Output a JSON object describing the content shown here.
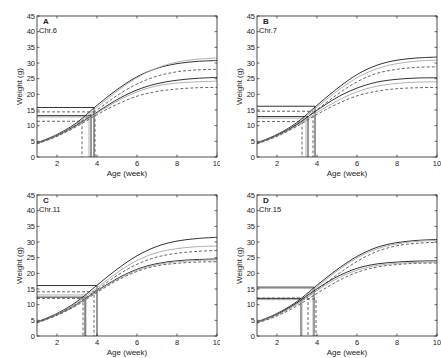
{
  "_note": "Only panel letters, chromosome labels, axis labels, and tick values are read directly from the figure. All curve points, plateau heights, knee points, and reference-line heights are ESTIMATED by reading pixels against gridlines; the figure has no data labels.",
  "chart_data": [
    {
      "type": "line",
      "panel": "A",
      "subtitle": "Chr.6",
      "xlabel": "Age (week)",
      "ylabel": "Weight (g)",
      "xlim": [
        1,
        10
      ],
      "ylim": [
        0,
        45
      ],
      "xticks": [
        2,
        4,
        6,
        8,
        10
      ],
      "yticks": [
        0,
        5,
        10,
        15,
        20,
        25,
        30,
        35,
        40,
        45
      ],
      "grid": false,
      "values_estimated": true,
      "series": [
        {
          "name": "solid-upper",
          "style": "solid",
          "x": [
            1,
            2,
            3,
            4,
            5,
            6,
            7,
            8,
            9,
            10
          ],
          "y": [
            4.5,
            7.2,
            11,
            16.5,
            21.5,
            25.6,
            28.3,
            29.8,
            30.5,
            30.8
          ]
        },
        {
          "name": "gray-upper",
          "style": "gray",
          "x": [
            1,
            2,
            3,
            4,
            5,
            6,
            7,
            8,
            9,
            10
          ],
          "y": [
            4.4,
            7.0,
            10.6,
            15.8,
            21.0,
            25.3,
            28.4,
            30.3,
            31.2,
            31.6
          ]
        },
        {
          "name": "dashed-upper",
          "style": "dashed",
          "x": [
            1,
            2,
            3,
            4,
            5,
            6,
            7,
            8,
            9,
            10
          ],
          "y": [
            4.3,
            6.9,
            10.4,
            15.0,
            19.6,
            23.3,
            25.8,
            27.2,
            27.8,
            28.0
          ]
        },
        {
          "name": "solid-lower",
          "style": "solid",
          "x": [
            1,
            2,
            3,
            4,
            5,
            6,
            7,
            8,
            9,
            10
          ],
          "y": [
            4.3,
            6.8,
            10.2,
            14.3,
            18.3,
            21.4,
            23.4,
            24.5,
            25.1,
            25.4
          ]
        },
        {
          "name": "gray-lower",
          "style": "gray",
          "x": [
            1,
            2,
            3,
            4,
            5,
            6,
            7,
            8,
            9,
            10
          ],
          "y": [
            4.2,
            6.7,
            10.0,
            14.0,
            17.8,
            20.8,
            22.7,
            23.6,
            24.0,
            24.2
          ]
        },
        {
          "name": "dashed-lower",
          "style": "dashed",
          "x": [
            1,
            2,
            3,
            4,
            5,
            6,
            7,
            8,
            9,
            10
          ],
          "y": [
            4.2,
            6.6,
            9.8,
            13.5,
            16.8,
            19.4,
            20.9,
            21.7,
            22.1,
            22.2
          ]
        }
      ],
      "ref_lines": [
        {
          "style": "solid",
          "y": 15.8,
          "x": 3.85
        },
        {
          "style": "dashed",
          "y": 14.4,
          "x": 3.9
        },
        {
          "style": "gray",
          "y": 12.8,
          "x": 3.6
        },
        {
          "style": "dashed",
          "y": 11.4,
          "x": 3.25
        },
        {
          "style": "solid",
          "y": 13.2,
          "x": 3.7
        }
      ]
    },
    {
      "type": "line",
      "panel": "B",
      "subtitle": "Chr.7",
      "xlabel": "Age (week)",
      "ylabel": "Weight (g)",
      "xlim": [
        1,
        10
      ],
      "ylim": [
        0,
        45
      ],
      "xticks": [
        2,
        4,
        6,
        8,
        10
      ],
      "yticks": [
        0,
        5,
        10,
        15,
        20,
        25,
        30,
        35,
        40,
        45
      ],
      "grid": false,
      "values_estimated": true,
      "series": [
        {
          "name": "solid-upper",
          "style": "solid",
          "x": [
            1,
            2,
            3,
            4,
            5,
            6,
            7,
            8,
            9,
            10
          ],
          "y": [
            4.5,
            7.2,
            11,
            16.5,
            21.8,
            26.3,
            29.3,
            30.9,
            31.6,
            31.9
          ]
        },
        {
          "name": "gray-upper",
          "style": "gray",
          "x": [
            1,
            2,
            3,
            4,
            5,
            6,
            7,
            8,
            9,
            10
          ],
          "y": [
            4.4,
            7.0,
            10.7,
            15.9,
            21.0,
            25.3,
            28.2,
            29.8,
            30.6,
            30.9
          ]
        },
        {
          "name": "dashed-upper",
          "style": "dashed",
          "x": [
            1,
            2,
            3,
            4,
            5,
            6,
            7,
            8,
            9,
            10
          ],
          "y": [
            4.3,
            6.9,
            10.4,
            15.1,
            19.9,
            24.0,
            26.7,
            28.0,
            28.6,
            28.8
          ]
        },
        {
          "name": "solid-lower",
          "style": "solid",
          "x": [
            1,
            2,
            3,
            4,
            5,
            6,
            7,
            8,
            9,
            10
          ],
          "y": [
            4.3,
            6.9,
            10.4,
            14.9,
            19.0,
            22.0,
            23.9,
            24.8,
            25.2,
            25.3
          ]
        },
        {
          "name": "gray-lower",
          "style": "gray",
          "x": [
            1,
            2,
            3,
            4,
            5,
            6,
            7,
            8,
            9,
            10
          ],
          "y": [
            4.2,
            6.7,
            10.0,
            14.2,
            17.9,
            20.8,
            22.6,
            23.5,
            23.9,
            24.0
          ]
        },
        {
          "name": "dashed-lower",
          "style": "dashed",
          "x": [
            1,
            2,
            3,
            4,
            5,
            6,
            7,
            8,
            9,
            10
          ],
          "y": [
            4.2,
            6.6,
            9.8,
            13.6,
            16.9,
            19.5,
            21.0,
            21.8,
            22.1,
            22.2
          ]
        }
      ],
      "ref_lines": [
        {
          "style": "solid",
          "y": 16.2,
          "x": 3.9
        },
        {
          "style": "dashed",
          "y": 14.6,
          "x": 3.8
        },
        {
          "style": "solid",
          "y": 12.9,
          "x": 3.55
        },
        {
          "style": "gray",
          "y": 12.4,
          "x": 3.45
        },
        {
          "style": "dashed",
          "y": 11.3,
          "x": 3.25
        }
      ]
    },
    {
      "type": "line",
      "panel": "C",
      "subtitle": "Chr.11",
      "xlabel": "Age (week)",
      "ylabel": "Weight (g)",
      "xlim": [
        1,
        10
      ],
      "ylim": [
        0,
        45
      ],
      "xticks": [
        2,
        4,
        6,
        8,
        10
      ],
      "yticks": [
        0,
        5,
        10,
        15,
        20,
        25,
        30,
        35,
        40,
        45
      ],
      "grid": false,
      "values_estimated": true,
      "series": [
        {
          "name": "solid-upper",
          "style": "solid",
          "x": [
            1,
            2,
            3,
            4,
            5,
            6,
            7,
            8,
            9,
            10
          ],
          "y": [
            4.5,
            7.2,
            11,
            16.2,
            21.3,
            25.6,
            28.6,
            30.3,
            31.1,
            31.5
          ]
        },
        {
          "name": "gray-upper",
          "style": "gray",
          "x": [
            1,
            2,
            3,
            4,
            5,
            6,
            7,
            8,
            9,
            10
          ],
          "y": [
            4.4,
            7.0,
            10.6,
            15.4,
            20.2,
            24.1,
            26.6,
            27.9,
            28.5,
            28.7
          ]
        },
        {
          "name": "dashed-upper",
          "style": "dashed",
          "x": [
            1,
            2,
            3,
            4,
            5,
            6,
            7,
            8,
            9,
            10
          ],
          "y": [
            4.3,
            6.9,
            10.3,
            14.8,
            19.3,
            22.9,
            25.2,
            26.4,
            27.0,
            27.3
          ]
        },
        {
          "name": "solid-lower",
          "style": "solid",
          "x": [
            1,
            2,
            3,
            4,
            5,
            6,
            7,
            8,
            9,
            10
          ],
          "y": [
            4.3,
            6.8,
            10.1,
            14.4,
            18.3,
            21.3,
            23.1,
            24.0,
            24.4,
            24.6
          ]
        },
        {
          "name": "gray-lower",
          "style": "gray",
          "x": [
            1,
            2,
            3,
            4,
            5,
            6,
            7,
            8,
            9,
            10
          ],
          "y": [
            4.2,
            6.7,
            10.0,
            14.2,
            18.0,
            21.0,
            22.8,
            23.7,
            24.1,
            24.3
          ]
        },
        {
          "name": "dashed-lower",
          "style": "dashed",
          "x": [
            1,
            2,
            3,
            4,
            5,
            6,
            7,
            8,
            9,
            10
          ],
          "y": [
            4.2,
            6.6,
            9.8,
            13.9,
            17.7,
            20.6,
            22.4,
            23.2,
            23.6,
            23.7
          ]
        }
      ],
      "ref_lines": [
        {
          "style": "solid",
          "y": 16.1,
          "x": 4.0
        },
        {
          "style": "dashed",
          "y": 14.1,
          "x": 3.85
        },
        {
          "style": "gray",
          "y": 13.1,
          "x": 3.45
        },
        {
          "style": "solid",
          "y": 12.4,
          "x": 3.4
        },
        {
          "style": "dashed",
          "y": 12.0,
          "x": 3.3
        }
      ]
    },
    {
      "type": "line",
      "panel": "D",
      "subtitle": "Chr.15",
      "xlabel": "Age (week)",
      "ylabel": "Weight (g)",
      "xlim": [
        1,
        10
      ],
      "ylim": [
        0,
        45
      ],
      "xticks": [
        2,
        4,
        6,
        8,
        10
      ],
      "yticks": [
        0,
        5,
        10,
        15,
        20,
        25,
        30,
        35,
        40,
        45
      ],
      "grid": false,
      "values_estimated": true,
      "series": [
        {
          "name": "solid-upper",
          "style": "solid",
          "x": [
            1,
            2,
            3,
            4,
            5,
            6,
            7,
            8,
            9,
            10
          ],
          "y": [
            4.5,
            7.2,
            11,
            16.2,
            21.2,
            25.4,
            28.3,
            29.8,
            30.5,
            30.8
          ]
        },
        {
          "name": "gray-upper",
          "style": "gray",
          "x": [
            1,
            2,
            3,
            4,
            5,
            6,
            7,
            8,
            9,
            10
          ],
          "y": [
            4.4,
            7.0,
            10.7,
            15.7,
            20.7,
            24.9,
            27.8,
            29.4,
            30.2,
            30.5
          ]
        },
        {
          "name": "dashed-upper",
          "style": "dashed",
          "x": [
            1,
            2,
            3,
            4,
            5,
            6,
            7,
            8,
            9,
            10
          ],
          "y": [
            4.3,
            6.8,
            10.2,
            14.7,
            19.5,
            23.8,
            27.0,
            28.8,
            29.6,
            29.9
          ]
        },
        {
          "name": "solid-lower",
          "style": "solid",
          "x": [
            1,
            2,
            3,
            4,
            5,
            6,
            7,
            8,
            9,
            10
          ],
          "y": [
            4.3,
            6.9,
            10.6,
            15.1,
            18.9,
            21.6,
            23.0,
            23.6,
            23.9,
            24.0
          ]
        },
        {
          "name": "gray-lower",
          "style": "gray",
          "x": [
            1,
            2,
            3,
            4,
            5,
            6,
            7,
            8,
            9,
            10
          ],
          "y": [
            4.2,
            6.7,
            10.2,
            14.5,
            18.3,
            21.0,
            22.5,
            23.2,
            23.5,
            23.6
          ]
        },
        {
          "name": "dashed-lower",
          "style": "dashed",
          "x": [
            1,
            2,
            3,
            4,
            5,
            6,
            7,
            8,
            9,
            10
          ],
          "y": [
            4.1,
            6.4,
            9.6,
            13.6,
            17.4,
            20.3,
            22.0,
            22.8,
            23.2,
            23.3
          ]
        }
      ],
      "ref_lines": [
        {
          "style": "solid",
          "y": 15.6,
          "x": 3.85
        },
        {
          "style": "gray",
          "y": 15.2,
          "x": 3.8
        },
        {
          "style": "dashed",
          "y": 12.1,
          "x": 3.55
        },
        {
          "style": "solid",
          "y": 12.0,
          "x": 3.2
        },
        {
          "style": "dashed",
          "y": 11.8,
          "x": 3.95
        },
        {
          "style": "gray",
          "y": 11.6,
          "x": 3.25
        }
      ]
    }
  ],
  "panels": [
    {
      "letter": "A",
      "subtitle": "Chr.6"
    },
    {
      "letter": "B",
      "subtitle": "Chr.7"
    },
    {
      "letter": "C",
      "subtitle": "Chr.11"
    },
    {
      "letter": "D",
      "subtitle": "Chr.15"
    }
  ],
  "axes": {
    "xlabel": "Age (week)",
    "ylabel": "Weight (g)"
  },
  "colors": {
    "solid": "#333333",
    "dashed": "#555555",
    "gray": "#a8a8a8",
    "axis": "#222222"
  }
}
